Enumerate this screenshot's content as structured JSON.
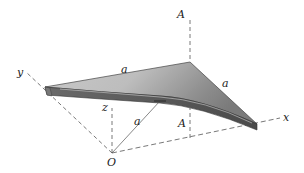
{
  "figure": {
    "labels": {
      "origin": "O",
      "axis_x": "x",
      "axis_y": "y",
      "axis_z": "z",
      "edge_top": "a",
      "edge_right": "a",
      "radius": "a",
      "section_top": "A",
      "section_bottom": "A"
    },
    "colors": {
      "plate_top_light": "#d6d6d6",
      "plate_top_dark": "#8a8a8a",
      "plate_edge": "#5a5a5a",
      "line": "#444444",
      "background": "#ffffff"
    }
  }
}
